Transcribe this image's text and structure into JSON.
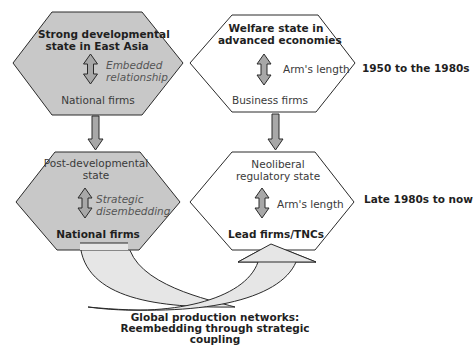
{
  "top_left": {
    "title_line1": "Strong developmental",
    "title_line2": "state in East Asia",
    "relation_line1": "Embedded",
    "relation_line2": "relationship",
    "firms": "National firms"
  },
  "top_right": {
    "title_line1": "Welfare state in",
    "title_line2": "advanced economies",
    "relation": "Arm's length",
    "firms": "Business firms"
  },
  "bottom_left": {
    "title_line1": "Post-developmental",
    "title_line2": "state",
    "relation_line1": "Strategic",
    "relation_line2": "disembedding",
    "firms": "National firms"
  },
  "bottom_right": {
    "title_line1": "Neoliberal",
    "title_line2": "regulatory state",
    "relation": "Arm's length",
    "firms": "Lead firms/TNCs"
  },
  "periods": {
    "top": "1950 to the 1980s",
    "bottom": "Late 1980s to now"
  },
  "caption": {
    "line1": "Global production networks:",
    "line2": "Reembedding through strategic",
    "line3": "coupling"
  },
  "colors": {
    "shaded_fill": "#c8c8c8",
    "arrow_fill": "#a8a8a8",
    "curve_fill": "#e6e6e6",
    "stroke": "#2a2a2a"
  }
}
